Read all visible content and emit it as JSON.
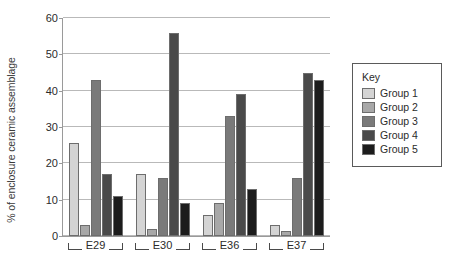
{
  "chart_data": {
    "type": "bar",
    "title": "",
    "xlabel": "",
    "ylabel": "% of enclosure ceramic assemblage",
    "ylim": [
      0,
      60
    ],
    "yticks": [
      0,
      10,
      20,
      30,
      40,
      50,
      60
    ],
    "grid": true,
    "categories": [
      "E29",
      "E30",
      "E36",
      "E37"
    ],
    "legend_title": "Key",
    "legend_position": "right",
    "series": [
      {
        "name": "Group 1",
        "color": "#d4d4d4",
        "values": [
          25.5,
          17.0,
          5.7,
          3.0
        ]
      },
      {
        "name": "Group 2",
        "color": "#a8a8a8",
        "values": [
          3.0,
          2.0,
          9.0,
          1.5
        ]
      },
      {
        "name": "Group 3",
        "color": "#7a7a7a",
        "values": [
          43.0,
          16.0,
          33.0,
          16.0
        ]
      },
      {
        "name": "Group 4",
        "color": "#4a4a4a",
        "values": [
          17.0,
          56.0,
          39.0,
          45.0
        ]
      },
      {
        "name": "Group 5",
        "color": "#1c1c1c",
        "values": [
          11.0,
          9.0,
          13.0,
          43.0
        ]
      }
    ]
  }
}
